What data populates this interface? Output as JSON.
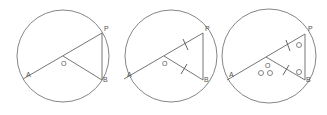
{
  "diagrams": [
    {
      "id": "figure-1",
      "labels": {
        "P": "P",
        "B": "B",
        "A": "A",
        "O": "O"
      },
      "features": [
        "circle",
        "diameter-AP",
        "radius-OB",
        "chord-PB"
      ]
    },
    {
      "id": "figure-2",
      "labels": {
        "P": "P",
        "B": "B",
        "A": "A",
        "O": "O"
      },
      "features": [
        "circle",
        "diameter-AP",
        "radius-OB",
        "chord-PB",
        "equal-tick-OP",
        "equal-tick-OB"
      ]
    },
    {
      "id": "figure-3",
      "labels": {
        "P": "P",
        "B": "B",
        "A": "A",
        "O": "O"
      },
      "angle_marks": {
        "at_P": "O",
        "at_B": "O",
        "at_O": "O O"
      },
      "features": [
        "circle",
        "diameter-AP",
        "radius-OB",
        "chord-PB",
        "equal-tick-OP",
        "equal-tick-OB",
        "equal-angles-P-B"
      ]
    }
  ]
}
